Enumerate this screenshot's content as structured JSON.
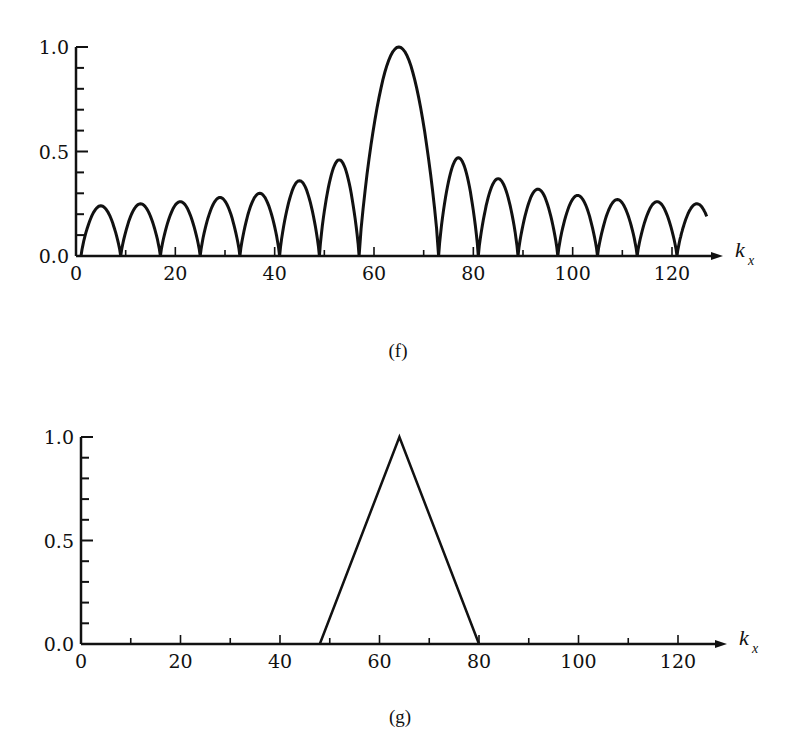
{
  "chart_data": [
    {
      "id": "f",
      "type": "line",
      "title": "",
      "caption": "(f)",
      "xlabel": "k",
      "xlabel_subscript": "x",
      "ylabel": "",
      "xlim": [
        0,
        130
      ],
      "ylim": [
        0,
        1.0
      ],
      "grid": false,
      "legend": null,
      "x_ticks": [
        0,
        20,
        40,
        60,
        80,
        100,
        120
      ],
      "x_tick_labels": [
        "0",
        "20",
        "40",
        "60",
        "80",
        "100",
        "120"
      ],
      "x_minor_ticks": [
        10,
        30,
        50,
        70,
        90,
        110
      ],
      "y_ticks": [
        0.0,
        0.5,
        1.0
      ],
      "y_tick_labels": [
        "0.0",
        "0.5",
        "1.0"
      ],
      "y_minor_ticks": [
        0.1,
        0.2,
        0.3,
        0.4,
        0.6,
        0.7,
        0.8,
        0.9
      ],
      "description": "Magnitude of a sinc-like spectrum: main lobe centered at k_x ≈ 65 with sidelobes of period ≈ 8",
      "lobes": [
        {
          "start": 1,
          "end": 9,
          "peak_x": 5,
          "peak_y": 0.24
        },
        {
          "start": 9,
          "end": 17,
          "peak_x": 13,
          "peak_y": 0.25
        },
        {
          "start": 17,
          "end": 25,
          "peak_x": 21,
          "peak_y": 0.26
        },
        {
          "start": 25,
          "end": 33,
          "peak_x": 29,
          "peak_y": 0.28
        },
        {
          "start": 33,
          "end": 41,
          "peak_x": 37,
          "peak_y": 0.3
        },
        {
          "start": 41,
          "end": 49,
          "peak_x": 45,
          "peak_y": 0.36
        },
        {
          "start": 49,
          "end": 57,
          "peak_x": 53,
          "peak_y": 0.46
        },
        {
          "start": 57,
          "end": 73,
          "peak_x": 65,
          "peak_y": 1.0
        },
        {
          "start": 73,
          "end": 81,
          "peak_x": 77,
          "peak_y": 0.47
        },
        {
          "start": 81,
          "end": 89,
          "peak_x": 85,
          "peak_y": 0.37
        },
        {
          "start": 89,
          "end": 97,
          "peak_x": 93,
          "peak_y": 0.32
        },
        {
          "start": 97,
          "end": 105,
          "peak_x": 101,
          "peak_y": 0.29
        },
        {
          "start": 105,
          "end": 113,
          "peak_x": 109,
          "peak_y": 0.27
        },
        {
          "start": 113,
          "end": 121,
          "peak_x": 117,
          "peak_y": 0.26
        },
        {
          "start": 121,
          "end": 129,
          "peak_x": 125,
          "peak_y": 0.25,
          "clip_end": 127
        }
      ],
      "layout": {
        "x0_px": 76,
        "x120_px": 672,
        "y0_px": 256,
        "y1_px": 47,
        "arrow_end_px": 723
      }
    },
    {
      "id": "g",
      "type": "line",
      "title": "",
      "caption": "(g)",
      "xlabel": "k",
      "xlabel_subscript": "x",
      "ylabel": "",
      "xlim": [
        0,
        130
      ],
      "ylim": [
        0,
        1.0
      ],
      "grid": false,
      "legend": null,
      "x_ticks": [
        0,
        20,
        40,
        60,
        80,
        100,
        120
      ],
      "x_tick_labels": [
        "0",
        "20",
        "40",
        "60",
        "80",
        "100",
        "120"
      ],
      "x_minor_ticks": [
        10,
        30,
        50,
        70,
        90,
        110
      ],
      "y_ticks": [
        0.0,
        0.5,
        1.0
      ],
      "y_tick_labels": [
        "0.0",
        "0.5",
        "1.0"
      ],
      "y_minor_ticks": [
        0.1,
        0.2,
        0.3,
        0.4,
        0.6,
        0.7,
        0.8,
        0.9
      ],
      "description": "Triangular window spanning k_x = 48 to 80 with peak 1.0 at k_x = 64",
      "x": [
        0,
        48,
        64,
        80,
        128
      ],
      "values": [
        0,
        0,
        1.0,
        0,
        0
      ],
      "layout": {
        "x0_px": 81,
        "x120_px": 678,
        "y0_px": 644,
        "y1_px": 437,
        "arrow_end_px": 727
      }
    }
  ]
}
